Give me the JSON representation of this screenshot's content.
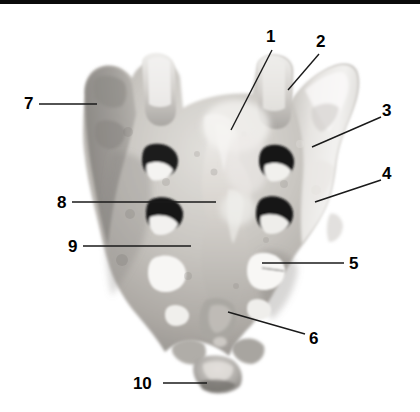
{
  "figure": {
    "kind": "anatomical-photograph",
    "background_color": "#ffffff",
    "top_bar_color": "#0a0a0a",
    "label_color": "#000000",
    "leader_line_color": "#1a1a1a",
    "bone_tone_light": "#e8e6e2",
    "bone_tone_mid": "#b9b6b1",
    "bone_tone_dark": "#7c7a77",
    "foramen_color": "#181818"
  },
  "labels": [
    {
      "id": "1",
      "text": "1",
      "x": 266,
      "y": 28,
      "line": {
        "x1": 272,
        "y1": 50,
        "x2": 231,
        "y2": 130
      }
    },
    {
      "id": "2",
      "text": "2",
      "x": 316,
      "y": 33,
      "line": {
        "x1": 319,
        "y1": 54,
        "x2": 288,
        "y2": 90
      }
    },
    {
      "id": "3",
      "text": "3",
      "x": 382,
      "y": 102,
      "line": {
        "x1": 381,
        "y1": 117,
        "x2": 312,
        "y2": 147
      }
    },
    {
      "id": "4",
      "text": "4",
      "x": 382,
      "y": 165,
      "line": {
        "x1": 381,
        "y1": 180,
        "x2": 315,
        "y2": 202
      }
    },
    {
      "id": "5",
      "text": "5",
      "x": 349,
      "y": 255,
      "line": {
        "x1": 344,
        "y1": 263,
        "x2": 262,
        "y2": 263
      }
    },
    {
      "id": "6",
      "text": "6",
      "x": 309,
      "y": 330,
      "line": {
        "x1": 305,
        "y1": 334,
        "x2": 228,
        "y2": 312
      }
    },
    {
      "id": "7",
      "text": "7",
      "x": 24,
      "y": 95,
      "line": {
        "x1": 39,
        "y1": 104,
        "x2": 97,
        "y2": 104
      }
    },
    {
      "id": "8",
      "text": "8",
      "x": 57,
      "y": 194,
      "line": {
        "x1": 72,
        "y1": 202,
        "x2": 216,
        "y2": 202
      }
    },
    {
      "id": "9",
      "text": "9",
      "x": 68,
      "y": 238,
      "line": {
        "x1": 83,
        "y1": 246,
        "x2": 191,
        "y2": 246
      }
    },
    {
      "id": "10",
      "text": "10",
      "x": 133,
      "y": 375,
      "line": {
        "x1": 163,
        "y1": 383,
        "x2": 207,
        "y2": 383
      }
    }
  ]
}
